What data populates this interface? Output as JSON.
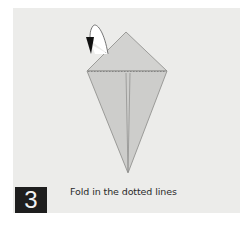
{
  "step": {
    "number": "3",
    "caption": "Fold in the dotted lines"
  },
  "diagram": {
    "shape": "kite-fold",
    "paper_color": "#cfcfcd",
    "line_color": "#8a8a88",
    "icons": [
      "fold-arrow-icon"
    ]
  },
  "colors": {
    "background": "#ffffff",
    "panel": "#ececea",
    "step_box": "#1e1e1e"
  }
}
